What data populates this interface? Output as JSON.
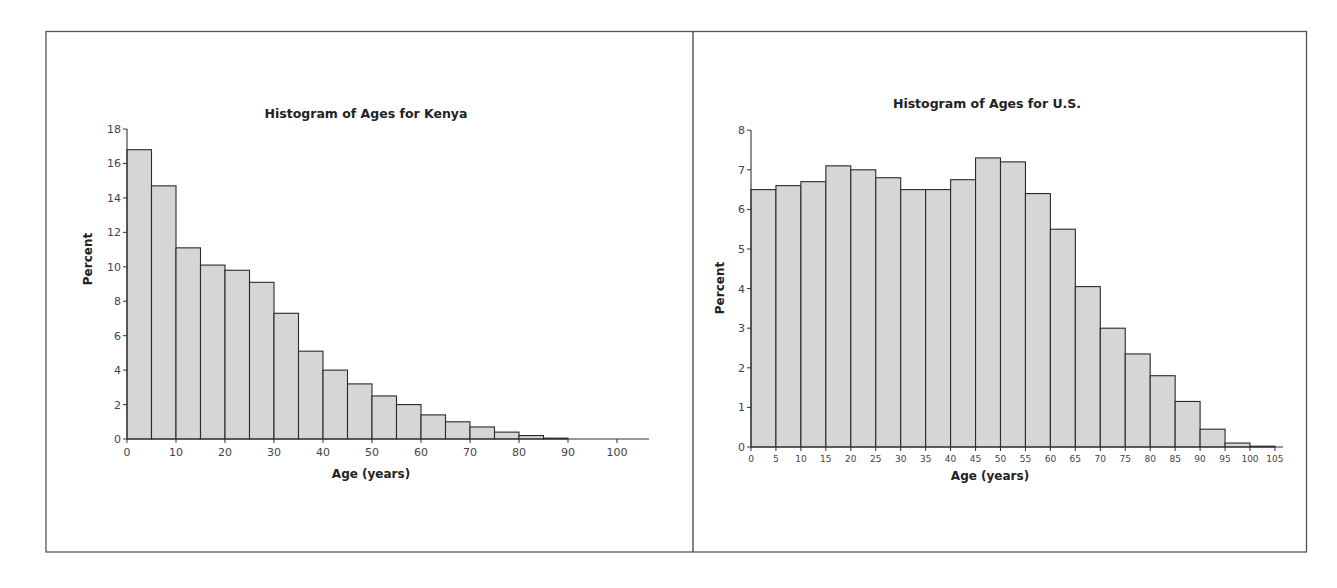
{
  "layout": {
    "frame": {
      "x": 46,
      "y": 31,
      "w": 1261,
      "h": 521,
      "divider_x": 693
    },
    "colors": {
      "bar_fill": "#d6d6d6",
      "bar_stroke": "#2a2a2a",
      "axis": "#333333",
      "frame": "#555555"
    }
  },
  "chart_data": [
    {
      "id": "kenya",
      "type": "bar",
      "title": "Histogram of Ages for Kenya",
      "xlabel": "Age (years)",
      "ylabel": "Percent",
      "bin_width": 5,
      "bins_start": [
        0,
        5,
        10,
        15,
        20,
        25,
        30,
        35,
        40,
        45,
        50,
        55,
        60,
        65,
        70,
        75,
        80,
        85
      ],
      "values": [
        16.8,
        14.7,
        11.1,
        10.1,
        9.8,
        9.1,
        7.3,
        5.1,
        4.0,
        3.2,
        2.5,
        2.0,
        1.4,
        1.0,
        0.7,
        0.4,
        0.2,
        0.05
      ],
      "xticks": [
        0,
        10,
        20,
        30,
        40,
        50,
        60,
        70,
        80,
        90,
        100
      ],
      "yticks": [
        0,
        2,
        4,
        6,
        8,
        10,
        12,
        14,
        16,
        18
      ],
      "xlim": [
        0,
        107
      ],
      "ylim": [
        0,
        18
      ],
      "grid": false,
      "legend": "none",
      "px": {
        "x0": 127,
        "xscale": 4.9,
        "y0": 439,
        "yscale": 17.22,
        "x_axis_end": 649
      }
    },
    {
      "id": "us",
      "type": "bar",
      "title": "Histogram of Ages for U.S.",
      "xlabel": "Age (years)",
      "ylabel": "Percent",
      "bin_width": 5,
      "bins_start": [
        0,
        5,
        10,
        15,
        20,
        25,
        30,
        35,
        40,
        45,
        50,
        55,
        60,
        65,
        70,
        75,
        80,
        85,
        90,
        95,
        100
      ],
      "values": [
        6.5,
        6.6,
        6.7,
        7.1,
        7.0,
        6.8,
        6.5,
        6.5,
        6.75,
        7.3,
        7.2,
        6.4,
        5.5,
        4.05,
        3.0,
        2.35,
        1.8,
        1.15,
        0.45,
        0.1,
        0.02
      ],
      "xticks": [
        0,
        5,
        10,
        15,
        20,
        25,
        30,
        35,
        40,
        45,
        50,
        55,
        60,
        65,
        70,
        75,
        80,
        85,
        90,
        95,
        100,
        105
      ],
      "yticks": [
        0,
        1,
        2,
        3,
        4,
        5,
        6,
        7,
        8
      ],
      "xlim": [
        0,
        106.5
      ],
      "ylim": [
        0,
        8
      ],
      "grid": false,
      "legend": "none",
      "px": {
        "x0": 751,
        "xscale": 4.99,
        "y0": 447,
        "yscale": 39.6,
        "x_axis_end": 1283
      }
    }
  ],
  "labels": {
    "kenya_title": "Histogram of Ages for Kenya",
    "kenya_xlabel": "Age (years)",
    "kenya_ylabel": "Percent",
    "us_title": "Histogram of Ages for U.S.",
    "us_xlabel": "Age (years)",
    "us_ylabel": "Percent"
  }
}
